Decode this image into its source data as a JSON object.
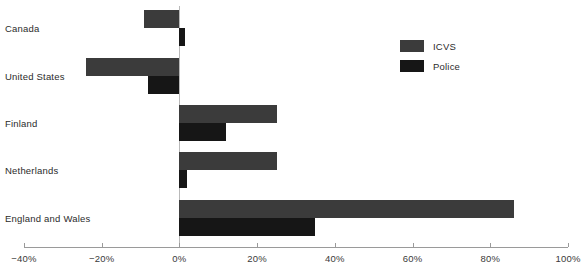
{
  "chart_data": {
    "type": "bar",
    "orientation": "horizontal",
    "title": "",
    "xlabel": "",
    "ylabel": "",
    "xlim": [
      -40,
      100
    ],
    "grid": false,
    "legend_position": "top-right",
    "categories": [
      "Canada",
      "United States",
      "Finland",
      "Netherlands",
      "England and Wales"
    ],
    "tick_labels": [
      "−40%",
      "−20%",
      "0%",
      "20%",
      "40%",
      "60%",
      "80%",
      "100%"
    ],
    "tick_values": [
      -40,
      -20,
      0,
      20,
      40,
      60,
      80,
      100
    ],
    "series": [
      {
        "name": "ICVS",
        "color": "#3b3b3b",
        "values": [
          -9,
          -24,
          25,
          25,
          86
        ]
      },
      {
        "name": "Police",
        "color": "#161616",
        "values": [
          1.5,
          -8,
          12,
          2,
          35
        ]
      }
    ]
  },
  "legend": {
    "items": [
      {
        "label": "ICVS",
        "color": "#3b3b3b"
      },
      {
        "label": "Police",
        "color": "#161616"
      }
    ]
  },
  "axis": {
    "zero_line_color": "#b9b9b9",
    "line_color": "#9a9a9a"
  }
}
